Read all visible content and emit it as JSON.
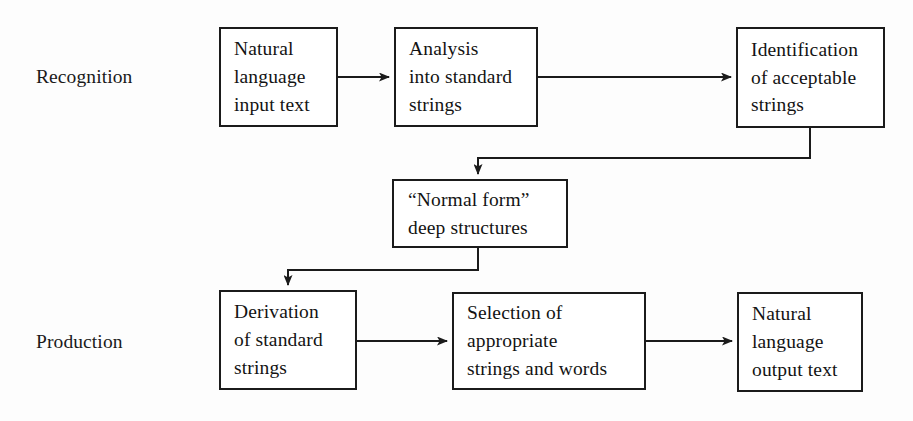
{
  "diagram": {
    "type": "flowchart",
    "width": 913,
    "height": 421,
    "colors": {
      "background": "#fdfdfd",
      "box_fill": "#ffffff",
      "stroke": "#1b1b1b",
      "text": "#131313"
    },
    "stage_labels": [
      {
        "id": "recognition",
        "text": "Recognition"
      },
      {
        "id": "production",
        "text": "Production"
      }
    ],
    "nodes": [
      {
        "id": "natural-language-input",
        "text": "Natural\nlanguage\ninput  text"
      },
      {
        "id": "analysis-standard",
        "text": "Analysis\ninto  standard\nstrings"
      },
      {
        "id": "identification-strings",
        "text": "Identification\nof  acceptable\nstrings"
      },
      {
        "id": "normal-form-deep",
        "text": "“Normal form”\ndeep  structures"
      },
      {
        "id": "derivation-standard",
        "text": "Derivation\nof  standard\nstrings"
      },
      {
        "id": "selection-appropriate",
        "text": "Selection of\nappropriate\nstrings  and  words"
      },
      {
        "id": "natural-language-output",
        "text": "Natural\nlanguage\noutput  text"
      }
    ],
    "edges": [
      {
        "id": "edge-input-to-analysis",
        "from": "natural-language-input",
        "to": "analysis-standard",
        "style": "straight-horizontal",
        "arrow": true
      },
      {
        "id": "edge-analysis-to-identification",
        "from": "analysis-standard",
        "to": "identification-strings",
        "style": "straight-horizontal",
        "arrow": true
      },
      {
        "id": "edge-identification-to-normal",
        "from": "identification-strings",
        "to": "normal-form-deep",
        "style": "down-left-down",
        "arrow": true
      },
      {
        "id": "edge-normal-to-derivation",
        "from": "normal-form-deep",
        "to": "derivation-standard",
        "style": "down-left-down",
        "arrow": true
      },
      {
        "id": "edge-derivation-to-selection",
        "from": "derivation-standard",
        "to": "selection-appropriate",
        "style": "straight-horizontal",
        "arrow": true
      },
      {
        "id": "edge-selection-to-output",
        "from": "selection-appropriate",
        "to": "natural-language-output",
        "style": "straight-horizontal",
        "arrow": true
      }
    ]
  }
}
